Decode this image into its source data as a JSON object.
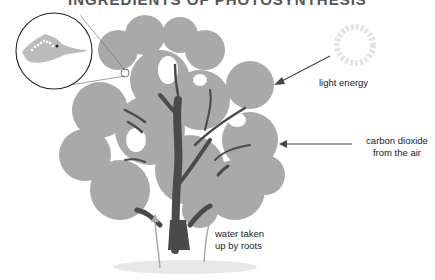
{
  "diagram": {
    "title": "INGREDIENTS OF PHOTOSYNTHESIS",
    "labels": {
      "light_energy": "light energy",
      "carbon_dioxide_line1": "carbon dioxide",
      "carbon_dioxide_line2": "from the air",
      "water_line1": "water taken",
      "water_line2": "up by roots"
    },
    "colors": {
      "foliage": "#a9a9a9",
      "trunk": "#4a4a4a",
      "arrow": "#444444",
      "sun": "#e4e4e4"
    },
    "elements": [
      "magnified leaf cross-section",
      "tree",
      "sun",
      "water arrows"
    ]
  }
}
